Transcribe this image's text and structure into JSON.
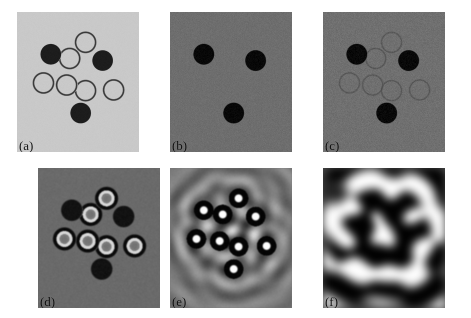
{
  "figure": {
    "kind": "multi-panel-grayscale-image-figure",
    "rows": 2,
    "cols": 3,
    "background": "#ffffff",
    "panel_count": 6
  },
  "panels": [
    {
      "id": "a",
      "label": "(a)",
      "row": 0,
      "col": 0,
      "x": 17,
      "y": 12,
      "w": 122,
      "h": 140,
      "background_gray": "#c9c9c9",
      "description": "Light gray uniform background with three solid dark filled disks and five thin dark outlined rings arranged in a cluster.",
      "filled_color": "#1d1d1d",
      "ring_stroke": "#3a3a3a",
      "ring_fill": "#c9c9c9",
      "ring_stroke_width": 1.2,
      "noise": 0.02,
      "blur": 0
    },
    {
      "id": "b",
      "label": "(b)",
      "row": 0,
      "col": 1,
      "x": 170,
      "y": 12,
      "w": 122,
      "h": 140,
      "background_gray": "#6e6e6e",
      "description": "Medium gray noisy background showing only three solid black disks; the outlined rings are not visible.",
      "filled_color": "#080808",
      "ring_stroke": "#6e6e6e",
      "ring_fill": "#6e6e6e",
      "ring_stroke_width": 0,
      "noise": 0.06,
      "blur": 0
    },
    {
      "id": "c",
      "label": "(c)",
      "row": 0,
      "col": 2,
      "x": 323,
      "y": 12,
      "w": 122,
      "h": 140,
      "background_gray": "#707070",
      "description": "Medium gray noisy background with three solid black disks plus five faint low-contrast outlined rings barely emerging from the noise.",
      "filled_color": "#090909",
      "ring_stroke": "#4e4e4e",
      "ring_fill": "#6f6f6f",
      "ring_stroke_width": 1.1,
      "noise": 0.08,
      "blur": 0.3
    },
    {
      "id": "d",
      "label": "(d)",
      "row": 1,
      "col": 0,
      "x": 38,
      "y": 168,
      "w": 122,
      "h": 140,
      "background_gray": "#6a6a6a",
      "description": "Reconstruction: five targets appear as concentric rings with a dark outer annulus, a bright inner annulus and gray core; three solid dark blobs remain.",
      "filled_color": "#121212",
      "ring_stroke": "#0a0a0a",
      "ring_fill": "#6a6a6a",
      "ring_bright": "#d8d8d8",
      "ring_stroke_width": 2.6,
      "noise": 0.07,
      "blur": 0.4
    },
    {
      "id": "e",
      "label": "(e)",
      "row": 1,
      "col": 1,
      "x": 170,
      "y": 168,
      "w": 122,
      "h": 140,
      "background_gray": "#777777",
      "description": "High contrast reconstruction with bright centers inside dark annuli and strong concentric diffraction fringes radiating outward across the field.",
      "filled_color": "#060606",
      "ring_stroke": "#050505",
      "ring_fill": "#f2f2f2",
      "ring_bright": "#ffffff",
      "ring_stroke_width": 5.0,
      "noise": 0.05,
      "blur": 0.6,
      "fringes": true
    },
    {
      "id": "f",
      "label": "(f)",
      "row": 1,
      "col": 2,
      "x": 323,
      "y": 168,
      "w": 122,
      "h": 140,
      "background_gray": "#4a4a4a",
      "description": "Heavily blurred very high contrast speckle pattern; individual targets are unresolved and merge into large bright and dark lobes.",
      "filled_color": "#000000",
      "ring_bright": "#ffffff",
      "noise": 0.03,
      "blur": 4.5,
      "speckle": true
    }
  ],
  "scatterers": {
    "note": "Normalized (0-1) positions within a panel; shared across all six panels (same object imaged under different conditions).",
    "radius_norm": 0.082,
    "items": [
      {
        "name": "disk-upper-left",
        "cx": 0.275,
        "cy": 0.3,
        "type": "filled"
      },
      {
        "name": "ring-top",
        "cx": 0.56,
        "cy": 0.215,
        "type": "outline"
      },
      {
        "name": "ring-upper-mid",
        "cx": 0.43,
        "cy": 0.33,
        "type": "outline"
      },
      {
        "name": "disk-upper-right",
        "cx": 0.7,
        "cy": 0.345,
        "type": "filled"
      },
      {
        "name": "ring-left",
        "cx": 0.215,
        "cy": 0.505,
        "type": "outline"
      },
      {
        "name": "ring-center",
        "cx": 0.405,
        "cy": 0.52,
        "type": "outline"
      },
      {
        "name": "ring-mid-right",
        "cx": 0.56,
        "cy": 0.56,
        "type": "outline"
      },
      {
        "name": "ring-far-right",
        "cx": 0.79,
        "cy": 0.555,
        "type": "outline"
      },
      {
        "name": "disk-bottom",
        "cx": 0.52,
        "cy": 0.72,
        "type": "filled"
      }
    ]
  },
  "labels": {
    "a": "(a)",
    "b": "(b)",
    "c": "(c)",
    "d": "(d)",
    "e": "(e)",
    "f": "(f)"
  }
}
